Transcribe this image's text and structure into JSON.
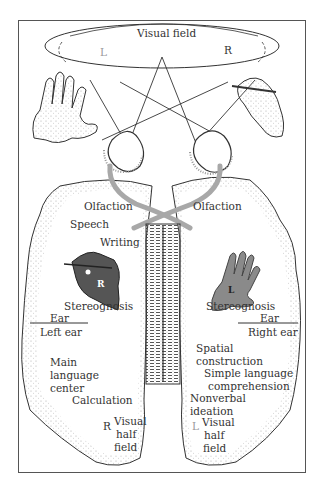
{
  "figure": {
    "visual_field": {
      "title": "Visual field",
      "left_marker": "L",
      "right_marker": "R"
    },
    "left_hemisphere": {
      "labels": {
        "olfaction": "Olfaction",
        "speech": "Speech",
        "writing": "Writing",
        "hand_marker": "R",
        "stereognosis": "Stereognosis",
        "ear": "Ear",
        "left_ear": "Left ear",
        "main": "Main",
        "language": "language",
        "center": "center",
        "calculation": "Calculation",
        "field_marker": "R",
        "visual": "Visual",
        "half": "half",
        "field": "field"
      }
    },
    "right_hemisphere": {
      "labels": {
        "olfaction": "Olfaction",
        "hand_marker": "L",
        "stereognosis": "Stereognosis",
        "ear": "Ear",
        "right_ear": "Right ear",
        "spatial": "Spatial",
        "construction": "construction",
        "simple_language": "Simple language",
        "comprehension": "comprehension",
        "nonverbal": "Nonverbal",
        "ideation": "ideation",
        "field_marker": "L",
        "visual": "Visual",
        "half": "half",
        "field": "field"
      }
    },
    "colors": {
      "ink": "#333333",
      "tract_grey": "#a8a8a8",
      "hand_fill": "#8a8a8a",
      "hand_fill_dark": "#555555",
      "faint_marker": "#9a9a9a",
      "stipple": "#b0b0b0"
    }
  }
}
